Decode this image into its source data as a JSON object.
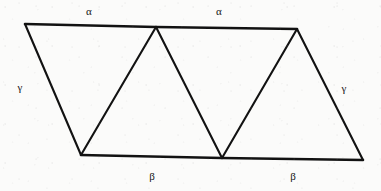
{
  "figure": {
    "type": "geometry-diagram",
    "canvas": {
      "width": 381,
      "height": 191
    },
    "background_color": "#fbfbfa",
    "stroke_color": "#121212",
    "stroke_width": 2.1,
    "vertices": {
      "top_left": {
        "x": 25,
        "y": 24
      },
      "top_middle": {
        "x": 156,
        "y": 27
      },
      "top_right": {
        "x": 297,
        "y": 29
      },
      "bottom_left": {
        "x": 81,
        "y": 155
      },
      "bottom_middle": {
        "x": 222,
        "y": 158
      },
      "bottom_right": {
        "x": 363,
        "y": 160
      }
    },
    "edges": [
      {
        "name": "top-edge-left",
        "from": "top_left",
        "to": "top_middle",
        "weight": "thick"
      },
      {
        "name": "top-edge-right",
        "from": "top_middle",
        "to": "top_right",
        "weight": "thick"
      },
      {
        "name": "bottom-edge-left",
        "from": "bottom_left",
        "to": "bottom_middle",
        "weight": "thick"
      },
      {
        "name": "bottom-edge-right",
        "from": "bottom_middle",
        "to": "bottom_right",
        "weight": "thick"
      },
      {
        "name": "left-slant-edge",
        "from": "top_left",
        "to": "bottom_left",
        "weight": "normal"
      },
      {
        "name": "diagonal-one",
        "from": "bottom_left",
        "to": "top_middle",
        "weight": "normal"
      },
      {
        "name": "diagonal-two",
        "from": "top_middle",
        "to": "bottom_middle",
        "weight": "normal"
      },
      {
        "name": "diagonal-three",
        "from": "bottom_middle",
        "to": "top_right",
        "weight": "normal"
      },
      {
        "name": "right-slant-edge",
        "from": "top_right",
        "to": "bottom_right",
        "weight": "normal"
      }
    ],
    "labels": [
      {
        "id": "alpha-top-left",
        "text": "α",
        "x": 89,
        "y": 11,
        "name": "angle-label-alpha-top-left"
      },
      {
        "id": "alpha-top-right",
        "text": "α",
        "x": 219,
        "y": 11,
        "name": "angle-label-alpha-top-right"
      },
      {
        "id": "gamma-left",
        "text": "γ",
        "x": 20,
        "y": 87,
        "name": "angle-label-gamma-left"
      },
      {
        "id": "gamma-right",
        "text": "γ",
        "x": 344,
        "y": 88,
        "name": "angle-label-gamma-right"
      },
      {
        "id": "beta-bottom-left",
        "text": "β",
        "x": 152,
        "y": 176,
        "name": "angle-label-beta-bottom-left"
      },
      {
        "id": "beta-bottom-right",
        "text": "β",
        "x": 293,
        "y": 176,
        "name": "angle-label-beta-bottom-right"
      }
    ]
  }
}
